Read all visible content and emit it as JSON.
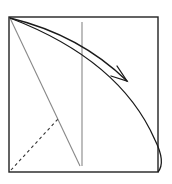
{
  "diagram": {
    "type": "origami-fold-step",
    "colors": {
      "edge": "#222222",
      "crease": "#888888",
      "arrow": "#1a1a1a",
      "background": "#ffffff"
    },
    "elements": {
      "paper_square": {
        "x": 9,
        "y": 17,
        "width": 149,
        "height": 155
      },
      "vertical_crease": {
        "x": 82,
        "y1": 22,
        "y2": 166
      },
      "diagonal_crease": {
        "x1": 10,
        "y1": 18,
        "x2": 80,
        "y2": 166
      },
      "valley_fold_line": {
        "x1": 11,
        "y1": 170,
        "x2": 58,
        "y2": 119,
        "style": "dashed"
      },
      "folded_flap_edge": "curve from top-left corner to bottom-right corner",
      "fold_arrow": "curved arrow from top-left corner toward right"
    }
  }
}
